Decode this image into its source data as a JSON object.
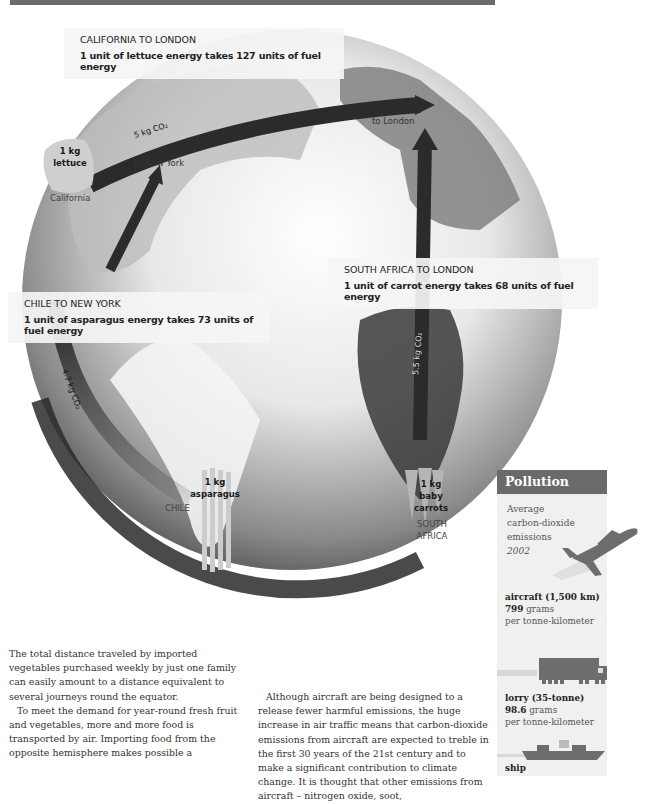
{
  "header_bar": {
    "color": "#6b6b6b"
  },
  "routes": [
    {
      "title": "CALIFORNIA TO LONDON",
      "subtitle": "1 unit of lettuce energy takes 127 units of fuel energy",
      "origin": "California",
      "destination_label": "to London",
      "produce": {
        "amount": "1 kg",
        "name": "lettuce"
      },
      "co2": "5 kg CO2"
    },
    {
      "title": "CHILE TO NEW YORK",
      "subtitle": "1 unit of asparagus energy takes 73 units of fuel energy",
      "origin": "CHILE",
      "destination_label": "to New York",
      "produce": {
        "amount": "1 kg",
        "name": "asparagus"
      },
      "co2": "4.7 kg CO2"
    },
    {
      "title": "SOUTH AFRICA TO LONDON",
      "subtitle": "1 unit of carrot energy takes 68 units of fuel energy",
      "origin_line1": "SOUTH",
      "origin_line2": "AFRICA",
      "produce": {
        "amount": "1 kg",
        "name_line1": "baby",
        "name_line2": "carrots"
      },
      "co2": "5.5 kg CO2"
    }
  ],
  "sidebar": {
    "title": "Pollution",
    "intro_line1": "Average",
    "intro_line2": "carbon-dioxide",
    "intro_line3": "emissions",
    "year": "2002",
    "items": [
      {
        "icon": "aircraft-icon",
        "label": "aircraft (1,500 km)",
        "value": "799",
        "unit": "grams",
        "per": "per tonne-kilometer"
      },
      {
        "icon": "lorry-icon",
        "label": "lorry (35-tonne)",
        "value": "98.6",
        "unit": "grams",
        "per": "per tonne-kilometer"
      },
      {
        "icon": "ship-icon",
        "label": "ship"
      }
    ]
  },
  "body": {
    "col1_p1": "The total distance traveled by imported vegetables purchased weekly by just one family can easily amount to a distance equivalent to several journeys round the equator.",
    "col1_p2": "To meet the demand for year-round fresh fruit and vegetables, more and more food is transported by air. Importing food from the opposite hemisphere makes possible a",
    "col2_p1": "Although aircraft are being designed to a release fewer harmful emissions, the huge increase in air traffic means that carbon-dioxide emissions from aircraft are expected to treble in the first 30 years of the 21st century and to make a significant contribution to climate change. It is thought that other emissions from aircraft – nitrogen oxide, soot,"
  }
}
